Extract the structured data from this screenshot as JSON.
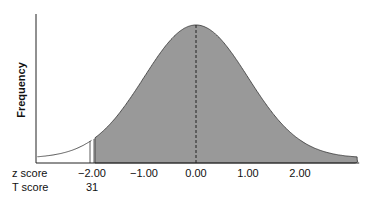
{
  "chart_data": {
    "type": "area",
    "title": "",
    "xlabel": "",
    "ylabel": "Frequency",
    "distribution": "normal",
    "mean": 0,
    "sd": 1,
    "xlim": [
      -3.05,
      3.1
    ],
    "shaded_from_z": -2.0,
    "unshaded_region": "below z = -2.00",
    "mean_line": {
      "z": 0.0,
      "style": "dashed"
    },
    "rows": [
      {
        "label": "z score",
        "ticks": [
          {
            "z": -2.0,
            "text": "−2.00"
          },
          {
            "z": -1.0,
            "text": "−1.00"
          },
          {
            "z": 0.0,
            "text": "0.00"
          },
          {
            "z": 1.0,
            "text": "1.00"
          },
          {
            "z": 2.0,
            "text": "2.00"
          }
        ]
      },
      {
        "label": "T score",
        "ticks": [
          {
            "z": -2.0,
            "text": "31"
          }
        ]
      }
    ],
    "colors": {
      "shaded": "#999999",
      "outline": "#333333",
      "axis": "#222222"
    }
  }
}
